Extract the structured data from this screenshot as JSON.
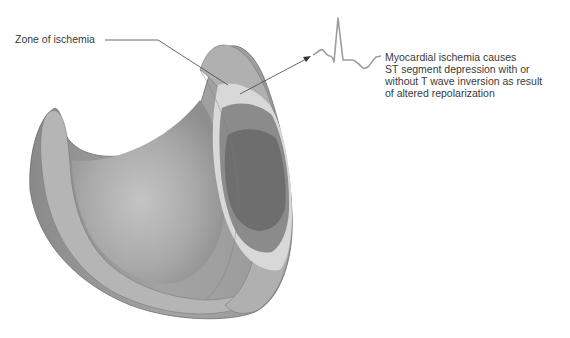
{
  "figure": {
    "labels": {
      "zone": "Zone of ischemia",
      "ecg_caption_lines": [
        "Myocardial ischemia causes",
        "ST segment depression with or",
        "without T wave inversion as result",
        "of altered repolarization"
      ]
    },
    "colors": {
      "outer_wall": "#9a9a9a",
      "wall_rim": "#b3b3b3",
      "inner_cavity": "#a6a6a6",
      "ischemia_outer": "#d6d6d6",
      "ischemia_mid": "#8a8a8a",
      "ischemia_core": "#707070",
      "ecg_trace": "#9c9c9c",
      "leader_line": "#444444"
    },
    "ecg": {
      "description": "ECG waveform showing ST segment depression"
    }
  }
}
